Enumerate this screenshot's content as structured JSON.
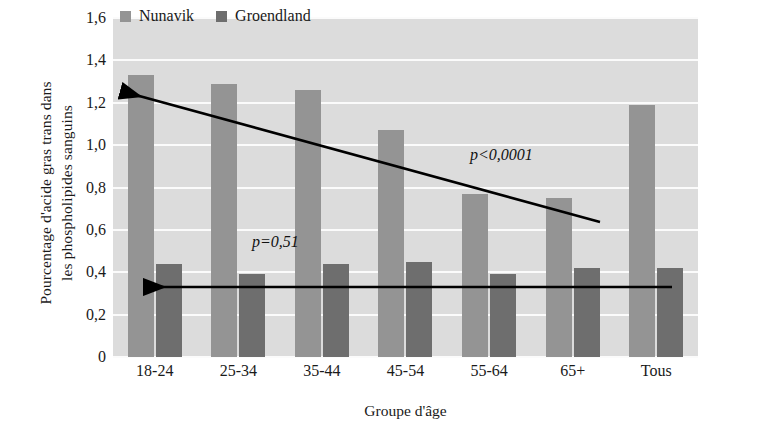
{
  "chart_data": {
    "type": "bar",
    "title": "",
    "xlabel": "Groupe d'âge",
    "ylabel_lines": [
      "Pourcentage d'acide gras trans dans",
      "les phospholipides sanguins"
    ],
    "categories": [
      "18-24",
      "25-34",
      "35-44",
      "45-54",
      "55-64",
      "65+",
      "Tous"
    ],
    "series": [
      {
        "name": "Nunavik",
        "color": "#949494",
        "values": [
          1.33,
          1.29,
          1.26,
          1.07,
          0.77,
          0.75,
          1.19
        ]
      },
      {
        "name": "Groendland",
        "color": "#6e6e6e",
        "values": [
          0.44,
          0.39,
          0.44,
          0.45,
          0.39,
          0.42,
          0.42
        ]
      }
    ],
    "ylim": [
      0,
      1.6
    ],
    "yticks": [
      0,
      0.2,
      0.4,
      0.6,
      0.8,
      1.0,
      1.2,
      1.4,
      1.6
    ],
    "ytick_labels": [
      "0",
      "0,2",
      "0,4",
      "0,6",
      "0,8",
      "1,0",
      "1,2",
      "1,4",
      "1,6"
    ],
    "grid": true,
    "legend_position": "top-center",
    "plot_background": "#dcdcdc",
    "gridline_color": "#fbfbfb",
    "annotations": [
      {
        "name": "nunavik-trend-annotation",
        "text": "p<0,0001",
        "text_x": 470,
        "text_y": 160,
        "arrow_from_x": 600,
        "arrow_from_y": 222,
        "arrow_to_x": 121,
        "arrow_to_y": 91
      },
      {
        "name": "groendland-trend-annotation",
        "text": "p=0,51",
        "text_x": 252,
        "text_y": 247,
        "arrow_from_x": 672,
        "arrow_from_y": 287,
        "arrow_to_x": 144,
        "arrow_to_y": 287
      }
    ]
  },
  "legend": {
    "items": [
      {
        "label": "Nunavik",
        "color": "#949494"
      },
      {
        "label": "Groendland",
        "color": "#6e6e6e"
      }
    ]
  }
}
